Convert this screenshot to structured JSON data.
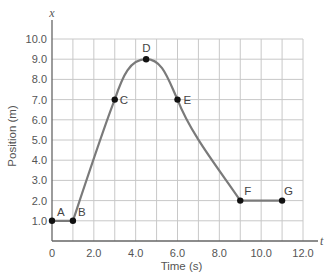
{
  "chart_data": {
    "type": "line",
    "title": "",
    "xlabel": "Time (s)",
    "ylabel": "Position (m)",
    "x_axis_var": "t",
    "y_axis_var": "x",
    "xlim": [
      0,
      12
    ],
    "ylim": [
      0,
      10
    ],
    "grid": true,
    "x_ticks": [
      {
        "value": 0,
        "label": "0"
      },
      {
        "value": 2,
        "label": "2.0"
      },
      {
        "value": 4,
        "label": "4.0"
      },
      {
        "value": 6,
        "label": "6.0"
      },
      {
        "value": 8,
        "label": "8.0"
      },
      {
        "value": 10,
        "label": "10.0"
      },
      {
        "value": 12,
        "label": "12.0"
      }
    ],
    "y_ticks": [
      {
        "value": 1,
        "label": "1.0"
      },
      {
        "value": 2,
        "label": "2.0"
      },
      {
        "value": 3,
        "label": "3.0"
      },
      {
        "value": 4,
        "label": "4.0"
      },
      {
        "value": 5,
        "label": "5.0"
      },
      {
        "value": 6,
        "label": "6.0"
      },
      {
        "value": 7,
        "label": "7.0"
      },
      {
        "value": 8,
        "label": "8.0"
      },
      {
        "value": 9,
        "label": "9.0"
      },
      {
        "value": 10,
        "label": "10.0"
      }
    ],
    "points": [
      {
        "label": "A",
        "x": 0,
        "y": 1.0
      },
      {
        "label": "B",
        "x": 1.0,
        "y": 1.0
      },
      {
        "label": "C",
        "x": 3.0,
        "y": 7.0
      },
      {
        "label": "D",
        "x": 4.5,
        "y": 9.0
      },
      {
        "label": "E",
        "x": 6.0,
        "y": 7.0
      },
      {
        "label": "F",
        "x": 9.0,
        "y": 2.0
      },
      {
        "label": "G",
        "x": 11.0,
        "y": 2.0
      }
    ],
    "series": [
      {
        "name": "position",
        "x": [
          0,
          1.0,
          3.0,
          4.5,
          6.0,
          9.0,
          11.0
        ],
        "y": [
          1.0,
          1.0,
          7.0,
          9.0,
          7.0,
          2.0,
          2.0
        ]
      }
    ],
    "colors": {
      "curve": "#7a7a7a",
      "grid": "#c8c8c8",
      "axis": "#666666",
      "point": "#111111"
    }
  }
}
